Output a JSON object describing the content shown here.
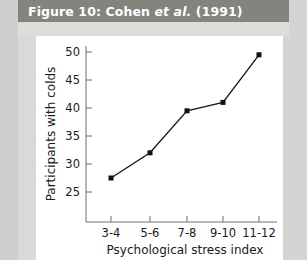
{
  "figure": {
    "caption_prefix": "Figure 10: Cohen ",
    "caption_italic": "et al.",
    "caption_suffix": " (1991)",
    "caption_full": "Figure 10: Cohen et al. (1991)"
  },
  "colors": {
    "caption_bar": "#84847f",
    "caption_text": "#ffffff",
    "page_background": "#d9d9d7",
    "plot_background": "#ffffff",
    "axis": "#6e6e6e",
    "series_line": "#1a1a1a",
    "marker": "#111111"
  },
  "chart_data": {
    "type": "line",
    "title": "Figure 10: Cohen et al. (1991)",
    "xlabel": "Psychological stress index",
    "ylabel": "Participants with colds",
    "categories": [
      "3-4",
      "5-6",
      "7-8",
      "9-10",
      "11-12"
    ],
    "values": [
      27.5,
      32,
      39.5,
      41,
      49.5
    ],
    "series": [
      {
        "name": "Participants with colds",
        "values": [
          27.5,
          32,
          39.5,
          41,
          49.5
        ]
      }
    ],
    "ylim": [
      22.5,
      51.5
    ],
    "yticks": [
      25,
      30,
      35,
      40,
      45,
      50
    ],
    "ytick_labels": [
      "25",
      "30",
      "35",
      "40",
      "45",
      "50"
    ],
    "xtick_labels": [
      "3-4",
      "5-6",
      "7-8",
      "9-10",
      "11-12"
    ],
    "grid": false,
    "legend": false,
    "markers": "filled-square"
  }
}
